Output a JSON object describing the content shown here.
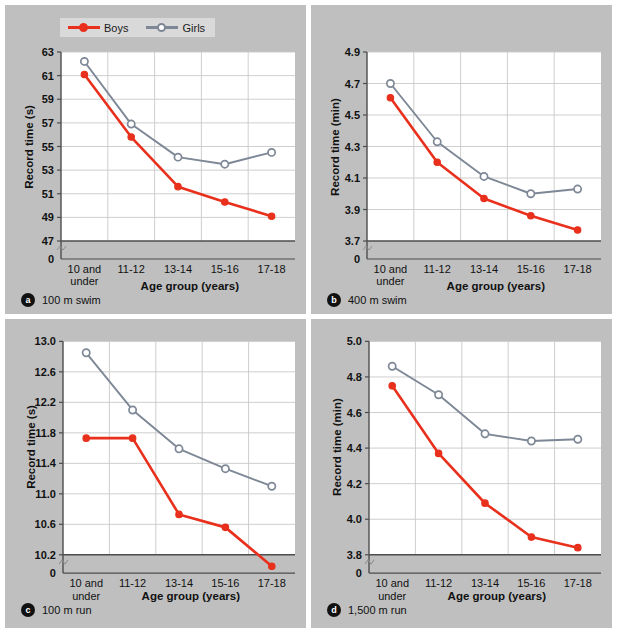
{
  "legend": {
    "items": [
      {
        "label": "Boys",
        "color": "#e8301c",
        "marker": "filled-circle"
      },
      {
        "label": "Girls",
        "color": "#7d8795",
        "marker": "open-circle"
      }
    ]
  },
  "colors": {
    "boys": "#e8301c",
    "girls": "#7d8795",
    "panel_bg": "#bfbfbf",
    "plot_bg": "#ffffff",
    "grid": "#c9c9c9",
    "axis": "#4d4d4d",
    "text": "#111111"
  },
  "categories": [
    "10 and under",
    "11-12",
    "13-14",
    "15-16",
    "17-18"
  ],
  "chart_data": [
    {
      "id": "a",
      "type": "line",
      "title": "100 m swim",
      "xlabel": "Age group (years)",
      "ylabel": "Record time (s)",
      "categories": [
        "10 and under",
        "11-12",
        "13-14",
        "15-16",
        "17-18"
      ],
      "yticks": [
        47,
        49,
        51,
        53,
        55,
        57,
        59,
        61,
        63
      ],
      "ytick_labels": [
        "47",
        "49",
        "51",
        "53",
        "55",
        "57",
        "59",
        "61",
        "63"
      ],
      "ylim": [
        47,
        63
      ],
      "axis_break": true,
      "zero_label": "0",
      "grid": true,
      "legend_position": "top-left",
      "series": [
        {
          "name": "Boys",
          "values": [
            61.1,
            55.8,
            51.6,
            50.3,
            49.1
          ]
        },
        {
          "name": "Girls",
          "values": [
            62.2,
            56.9,
            54.1,
            53.5,
            54.5
          ]
        }
      ]
    },
    {
      "id": "b",
      "type": "line",
      "title": "400 m swim",
      "xlabel": "Age group (years)",
      "ylabel": "Record time (min)",
      "categories": [
        "10 and under",
        "11-12",
        "13-14",
        "15-16",
        "17-18"
      ],
      "yticks": [
        3.7,
        3.9,
        4.1,
        4.3,
        4.5,
        4.7,
        4.9
      ],
      "ytick_labels": [
        "3.7",
        "3.9",
        "4.1",
        "4.3",
        "4.5",
        "4.7",
        "4.9"
      ],
      "ylim": [
        3.7,
        4.9
      ],
      "axis_break": true,
      "zero_label": "0",
      "grid": true,
      "legend_position": "none",
      "series": [
        {
          "name": "Boys",
          "values": [
            4.61,
            4.2,
            3.97,
            3.86,
            3.77
          ]
        },
        {
          "name": "Girls",
          "values": [
            4.7,
            4.33,
            4.11,
            4.0,
            4.03
          ]
        }
      ]
    },
    {
      "id": "c",
      "type": "line",
      "title": "100 m run",
      "xlabel": "Age group (years)",
      "ylabel": "Record time (s)",
      "categories": [
        "10 and under",
        "11-12",
        "13-14",
        "15-16",
        "17-18"
      ],
      "yticks": [
        10.2,
        10.6,
        11.0,
        11.4,
        11.8,
        12.2,
        12.6,
        13.0
      ],
      "ytick_labels": [
        "10.2",
        "10.6",
        "11.0",
        "11.4",
        "11.8",
        "12.2",
        "12.6",
        "13.0"
      ],
      "ylim": [
        10.2,
        13.0
      ],
      "axis_break": true,
      "zero_label": "0",
      "grid": true,
      "legend_position": "none",
      "series": [
        {
          "name": "Boys",
          "values": [
            11.73,
            11.73,
            10.73,
            10.56,
            10.05
          ]
        },
        {
          "name": "Girls",
          "values": [
            12.85,
            12.1,
            11.59,
            11.33,
            11.1
          ]
        }
      ]
    },
    {
      "id": "d",
      "type": "line",
      "title": "1,500 m run",
      "xlabel": "Age group (years)",
      "ylabel": "Record time (min)",
      "categories": [
        "10 and under",
        "11-12",
        "13-14",
        "15-16",
        "17-18"
      ],
      "yticks": [
        3.8,
        4.0,
        4.2,
        4.4,
        4.6,
        4.8,
        5.0
      ],
      "ytick_labels": [
        "3.8",
        "4.0",
        "4.2",
        "4.4",
        "4.6",
        "4.8",
        "5.0"
      ],
      "ylim": [
        3.8,
        5.0
      ],
      "axis_break": true,
      "zero_label": "0",
      "grid": true,
      "legend_position": "none",
      "series": [
        {
          "name": "Boys",
          "values": [
            4.75,
            4.37,
            4.09,
            3.9,
            3.84
          ]
        },
        {
          "name": "Girls",
          "values": [
            4.86,
            4.7,
            4.48,
            4.44,
            4.45
          ]
        }
      ]
    }
  ]
}
